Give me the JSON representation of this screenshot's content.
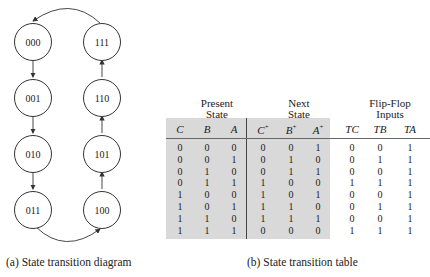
{
  "diagram": {
    "states_left": [
      "000",
      "001",
      "010",
      "011"
    ],
    "states_right": [
      "111",
      "110",
      "101",
      "100"
    ],
    "caption": "(a) State transition diagram"
  },
  "table": {
    "group_headers": {
      "present": "Present State",
      "present_l1": "Present",
      "present_l2": "State",
      "next_l1": "Next",
      "next_l2": "State",
      "ff_l1": "Flip-Flop",
      "ff_l2": "Inputs"
    },
    "columns": [
      "C",
      "B",
      "A",
      "C+",
      "B+",
      "A+",
      "TC",
      "TB",
      "TA"
    ],
    "rows": [
      [
        0,
        0,
        0,
        0,
        0,
        1,
        0,
        0,
        1
      ],
      [
        0,
        0,
        1,
        0,
        1,
        0,
        0,
        1,
        1
      ],
      [
        0,
        1,
        0,
        0,
        1,
        1,
        0,
        0,
        1
      ],
      [
        0,
        1,
        1,
        1,
        0,
        0,
        1,
        1,
        1
      ],
      [
        1,
        0,
        0,
        1,
        0,
        1,
        0,
        0,
        1
      ],
      [
        1,
        0,
        1,
        1,
        1,
        0,
        0,
        1,
        1
      ],
      [
        1,
        1,
        0,
        1,
        1,
        1,
        0,
        0,
        1
      ],
      [
        1,
        1,
        1,
        0,
        0,
        0,
        1,
        1,
        1
      ]
    ],
    "caption": "(b) State transition table"
  },
  "colors": {
    "shade": "#d9d9d9",
    "stroke": "#333333"
  }
}
